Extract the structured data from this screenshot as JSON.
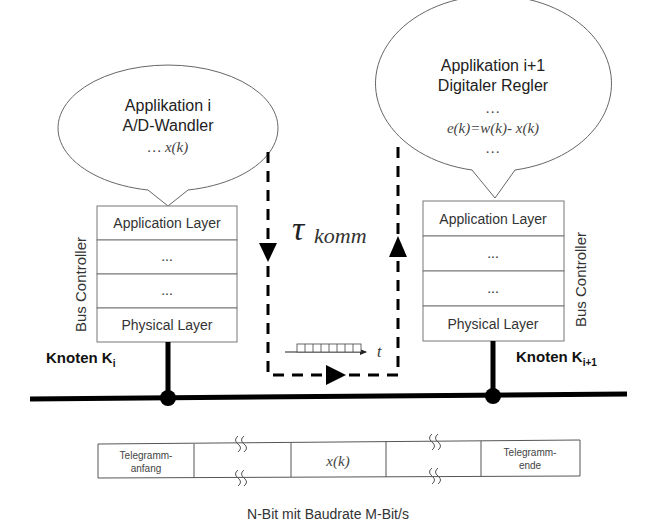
{
  "node_left": {
    "bubble": {
      "title": "Applikation i",
      "subtitle": "A/D-Wandler",
      "formula": "… x(k)"
    },
    "stack": {
      "side_label": "Bus Controller",
      "layers": [
        "Application Layer",
        "...",
        "...",
        "Physical Layer"
      ]
    },
    "knoten_label": "Knoten K",
    "knoten_sub": "i"
  },
  "node_right": {
    "bubble": {
      "title": "Applikation i+1",
      "subtitle": "Digitaler Regler",
      "dots_top": "…",
      "formula": "e(k)=w(k)- x(k)",
      "dots_bottom": "…"
    },
    "stack": {
      "side_label": "Bus Controller",
      "layers": [
        "Application Layer",
        "...",
        "...",
        "Physical Layer"
      ]
    },
    "knoten_label": "Knoten K",
    "knoten_sub": "i+1"
  },
  "delay": {
    "tau": "τ",
    "subscript": "komm",
    "time_axis_label": "t"
  },
  "telegram": {
    "cells": [
      "Telegramm-|anfang",
      "",
      "x(k)",
      "",
      "Telegramm-|ende"
    ]
  },
  "footer": "N-Bit mit Baudrate M-Bit/s",
  "colors": {
    "line": "#000000",
    "outline": "#555555",
    "text": "#222222"
  }
}
